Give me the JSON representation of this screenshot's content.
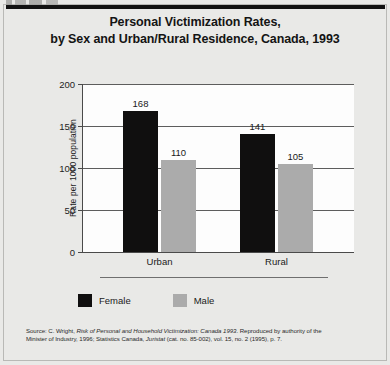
{
  "figure": {
    "background_color": "#e9e9e7",
    "plot_background_color": "#fdfdfd",
    "title_line1": "Personal Victimization Rates,",
    "title_line2": "by Sex and Urban/Rural Residence, Canada, 1993"
  },
  "chart_data": {
    "type": "bar",
    "title": "Personal Victimization Rates, by Sex and Urban/Rural Residence, Canada, 1993",
    "xlabel": "",
    "ylabel": "Rate per 1000 population",
    "categories": [
      "Urban",
      "Rural"
    ],
    "series": [
      {
        "name": "Female",
        "color": "#100f0f",
        "values": [
          168,
          141
        ]
      },
      {
        "name": "Male",
        "color": "#ababab",
        "values": [
          110,
          105
        ]
      }
    ],
    "series_by_category": {
      "Urban": {
        "Female": 168,
        "Male": 141
      },
      "Rural": {
        "Female": 110,
        "Male": 105
      }
    },
    "ylim": [
      0,
      200
    ],
    "yticks": [
      0,
      50,
      100,
      150,
      200
    ],
    "ytick_labels": [
      "0",
      "50",
      "100",
      "150",
      "200"
    ],
    "grid": true,
    "grid_axis": "y",
    "legend_position": "bottom-left",
    "data_labels": [
      "168",
      "141",
      "110",
      "105"
    ]
  },
  "legend": {
    "items": [
      {
        "label": "Female",
        "color": "#100f0f"
      },
      {
        "label": "Male",
        "color": "#ababab"
      }
    ]
  },
  "source": {
    "line1_pre": "Source: C. Wright, ",
    "line1_italic": "Risk of Personal and Household Victimization: Canada 1993",
    "line1_post": ". Reproduced by authority of the",
    "line2_pre": "Minister of Industry, 1996; Statistics Canada, ",
    "line2_italic": "Juristat",
    "line2_post": " (cat. no. 85-002), vol. 15, no. 2 (1995), p. 7."
  }
}
